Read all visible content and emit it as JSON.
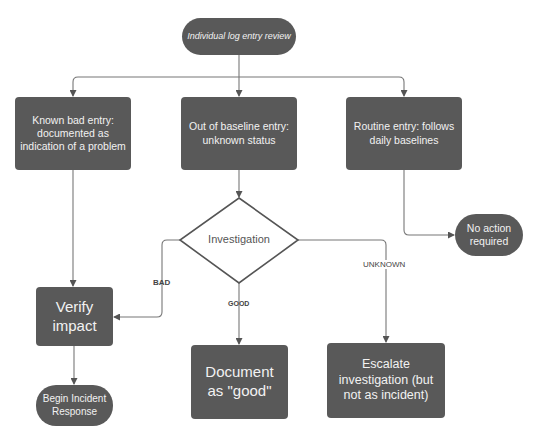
{
  "diagram": {
    "type": "flowchart",
    "colors": {
      "node_fill": "#595959",
      "node_text": "#f2f2f2",
      "line": "#666666",
      "decision_fill": "#ffffff",
      "decision_stroke": "#555555"
    },
    "start": {
      "label": "Individual log entry review"
    },
    "categories": [
      {
        "label": "Known bad entry: documented as indication of a problem"
      },
      {
        "label": "Out of baseline entry: unknown status"
      },
      {
        "label": "Routine entry: follows daily baselines"
      }
    ],
    "decision": {
      "label": "Investigation"
    },
    "edge_labels": {
      "bad": "BAD",
      "good": "GOOD",
      "unknown": "UNKNOWN"
    },
    "outcomes": {
      "no_action": {
        "label": "No action required"
      },
      "verify": {
        "label": "Verify impact"
      },
      "begin_ir": {
        "label": "Begin Incident Response"
      },
      "document": {
        "label": "Document as \"good\""
      },
      "escalate": {
        "label": "Escalate investigation (but not as incident)"
      }
    }
  }
}
